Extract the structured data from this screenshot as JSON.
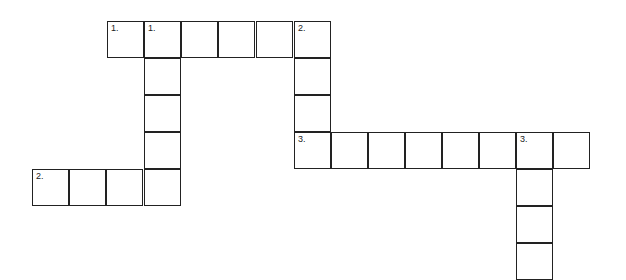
{
  "crossword": {
    "cell_size": 37,
    "cells": [
      {
        "x": 107,
        "y": 21,
        "number": "1."
      },
      {
        "x": 144,
        "y": 21,
        "number": "1."
      },
      {
        "x": 181,
        "y": 21,
        "number": ""
      },
      {
        "x": 218,
        "y": 21,
        "number": ""
      },
      {
        "x": 256,
        "y": 21,
        "number": ""
      },
      {
        "x": 294,
        "y": 21,
        "number": "2."
      },
      {
        "x": 144,
        "y": 58,
        "number": ""
      },
      {
        "x": 144,
        "y": 95,
        "number": ""
      },
      {
        "x": 144,
        "y": 132,
        "number": ""
      },
      {
        "x": 144,
        "y": 169,
        "number": ""
      },
      {
        "x": 294,
        "y": 58,
        "number": ""
      },
      {
        "x": 294,
        "y": 95,
        "number": ""
      },
      {
        "x": 294,
        "y": 132,
        "number": "3."
      },
      {
        "x": 331,
        "y": 132,
        "number": ""
      },
      {
        "x": 368,
        "y": 132,
        "number": ""
      },
      {
        "x": 405,
        "y": 132,
        "number": ""
      },
      {
        "x": 442,
        "y": 132,
        "number": ""
      },
      {
        "x": 479,
        "y": 132,
        "number": ""
      },
      {
        "x": 516,
        "y": 132,
        "number": "3."
      },
      {
        "x": 553,
        "y": 132,
        "number": ""
      },
      {
        "x": 516,
        "y": 169,
        "number": ""
      },
      {
        "x": 516,
        "y": 206,
        "number": ""
      },
      {
        "x": 516,
        "y": 243,
        "number": ""
      },
      {
        "x": 32,
        "y": 169,
        "number": "2."
      },
      {
        "x": 69,
        "y": 169,
        "number": ""
      },
      {
        "x": 106,
        "y": 169,
        "number": ""
      }
    ]
  }
}
